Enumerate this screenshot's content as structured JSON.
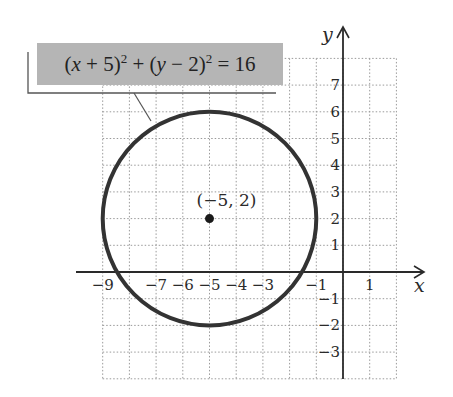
{
  "chart_data": {
    "type": "scatter",
    "title": "",
    "equation": "(x + 5)^2 + (y - 2)^2 = 16",
    "equation_parts": {
      "p1": "(",
      "v1": "x",
      "p2": " + 5)",
      "e1": "2",
      "p3": " + (",
      "v2": "y",
      "p4": " − 2)",
      "e2": "2",
      "p5": " = 16"
    },
    "shape": "circle",
    "center": {
      "x": -5,
      "y": 2,
      "label": "(−5, 2)"
    },
    "radius": 4,
    "xlabel": "x",
    "ylabel": "y",
    "xlim": [
      -10,
      2
    ],
    "ylim": [
      -4,
      8
    ],
    "grid": true,
    "grid_style": "dotted",
    "x_tick_labels": [
      "−9",
      "−7",
      "−6",
      "−5",
      "−4",
      "−3",
      "−1",
      "1"
    ],
    "x_tick_values": [
      -9,
      -7,
      -6,
      -5,
      -4,
      -3,
      -1,
      1
    ],
    "y_tick_labels": [
      "7",
      "6",
      "5",
      "4",
      "3",
      "2",
      "1",
      "−1",
      "−2",
      "−3"
    ],
    "y_tick_values": [
      7,
      6,
      5,
      4,
      3,
      2,
      1,
      -1,
      -2,
      -3
    ],
    "colors": {
      "circle": "#333333",
      "grid": "#9a9a9a",
      "axes": "#2a2a2a",
      "label_box": "#b5b5b5"
    }
  }
}
